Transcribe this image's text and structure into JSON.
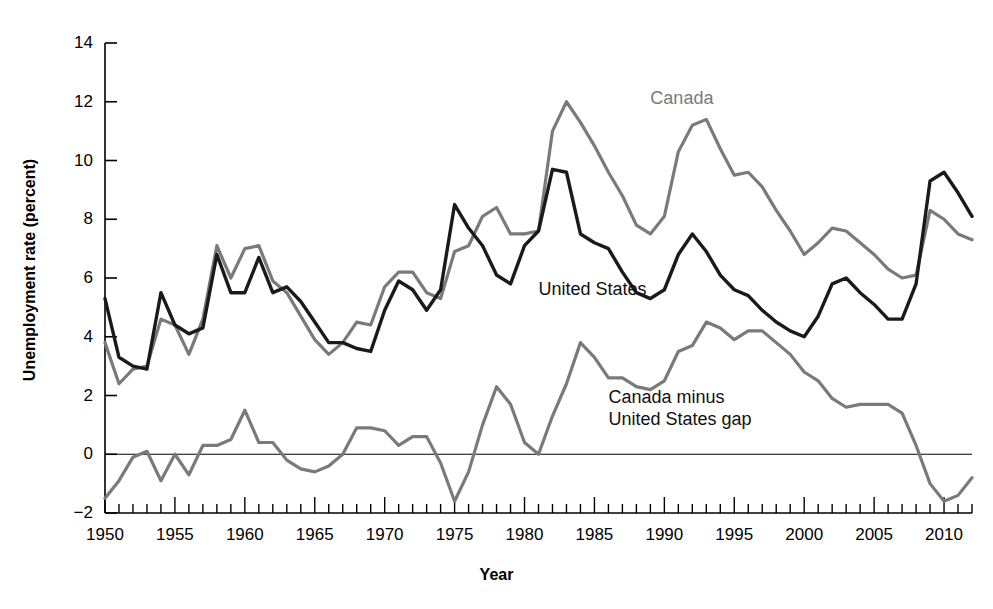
{
  "chart_data": {
    "type": "line",
    "title": "",
    "xlabel": "Year",
    "ylabel": "Unemployment rate (percent)",
    "xlim": [
      1950,
      2012
    ],
    "ylim": [
      -2,
      14
    ],
    "ytick_step": 2,
    "xtick_step": 5,
    "minor_xticks": "annual",
    "grid": false,
    "zero_line": true,
    "legend_position": "inline-annotations",
    "x": [
      1950,
      1951,
      1952,
      1953,
      1954,
      1955,
      1956,
      1957,
      1958,
      1959,
      1960,
      1961,
      1962,
      1963,
      1964,
      1965,
      1966,
      1967,
      1968,
      1969,
      1970,
      1971,
      1972,
      1973,
      1974,
      1975,
      1976,
      1977,
      1978,
      1979,
      1980,
      1981,
      1982,
      1983,
      1984,
      1985,
      1986,
      1987,
      1988,
      1989,
      1990,
      1991,
      1992,
      1993,
      1994,
      1995,
      1996,
      1997,
      1998,
      1999,
      2000,
      2001,
      2002,
      2003,
      2004,
      2005,
      2006,
      2007,
      2008,
      2009,
      2010,
      2011,
      2012
    ],
    "xticks": [
      1950,
      1955,
      1960,
      1965,
      1970,
      1975,
      1980,
      1985,
      1990,
      1995,
      2000,
      2005,
      2010
    ],
    "xtick_labels": [
      "1950",
      "1955",
      "1960",
      "1965",
      "1970",
      "1975",
      "1980",
      "1985",
      "1990",
      "1995",
      "2000",
      "2005",
      "2010"
    ],
    "yticks": [
      -2,
      0,
      2,
      4,
      6,
      8,
      10,
      12,
      14
    ],
    "ytick_labels": [
      "−2",
      "0",
      "2",
      "4",
      "6",
      "8",
      "10",
      "12",
      "14"
    ],
    "series": [
      {
        "name": "United States",
        "color": "#1a1a1a",
        "label_x": 1981,
        "label_y": 5.6,
        "values": [
          5.3,
          3.3,
          3.0,
          2.9,
          5.5,
          4.4,
          4.1,
          4.3,
          6.8,
          5.5,
          5.5,
          6.7,
          5.5,
          5.7,
          5.2,
          4.5,
          3.8,
          3.8,
          3.6,
          3.5,
          4.9,
          5.9,
          5.6,
          4.9,
          5.6,
          8.5,
          7.7,
          7.1,
          6.1,
          5.8,
          7.1,
          7.6,
          9.7,
          9.6,
          7.5,
          7.2,
          7.0,
          6.2,
          5.5,
          5.3,
          5.6,
          6.8,
          7.5,
          6.9,
          6.1,
          5.6,
          5.4,
          4.9,
          4.5,
          4.2,
          4.0,
          4.7,
          5.8,
          6.0,
          5.5,
          5.1,
          4.6,
          4.6,
          5.8,
          9.3,
          9.6,
          8.9,
          8.1
        ]
      },
      {
        "name": "Canada",
        "color": "#7a7a7a",
        "label_x": 1989,
        "label_y": 12.1,
        "values": [
          3.8,
          2.4,
          2.9,
          3.0,
          4.6,
          4.4,
          3.4,
          4.6,
          7.1,
          6.0,
          7.0,
          7.1,
          5.9,
          5.5,
          4.7,
          3.9,
          3.4,
          3.8,
          4.5,
          4.4,
          5.7,
          6.2,
          6.2,
          5.5,
          5.3,
          6.9,
          7.1,
          8.1,
          8.4,
          7.5,
          7.5,
          7.6,
          11.0,
          12.0,
          11.3,
          10.5,
          9.6,
          8.8,
          7.8,
          7.5,
          8.1,
          10.3,
          11.2,
          11.4,
          10.4,
          9.5,
          9.6,
          9.1,
          8.3,
          7.6,
          6.8,
          7.2,
          7.7,
          7.6,
          7.2,
          6.8,
          6.3,
          6.0,
          6.1,
          8.3,
          8.0,
          7.5,
          7.3
        ]
      },
      {
        "name": "Canada minus United States gap",
        "color": "#7a7a7a",
        "label_x": 1986,
        "label_y": 1.9,
        "values": [
          -1.5,
          -0.9,
          -0.1,
          0.1,
          -0.9,
          0.0,
          -0.7,
          0.3,
          0.3,
          0.5,
          1.5,
          0.4,
          0.4,
          -0.2,
          -0.5,
          -0.6,
          -0.4,
          0.0,
          0.9,
          0.9,
          0.8,
          0.3,
          0.6,
          0.6,
          -0.3,
          -1.6,
          -0.6,
          1.0,
          2.3,
          1.7,
          0.4,
          0.0,
          1.3,
          2.4,
          3.8,
          3.3,
          2.6,
          2.6,
          2.3,
          2.2,
          2.5,
          3.5,
          3.7,
          4.5,
          4.3,
          3.9,
          4.2,
          4.2,
          3.8,
          3.4,
          2.8,
          2.5,
          1.9,
          1.6,
          1.7,
          1.7,
          1.7,
          1.4,
          0.3,
          -1.0,
          -1.6,
          -1.4,
          -0.8
        ]
      }
    ],
    "annotations": [
      {
        "id": "canada",
        "text": "Canada"
      },
      {
        "id": "united-states",
        "text": "United States"
      },
      {
        "id": "gap-line1",
        "text": "Canada minus"
      },
      {
        "id": "gap-line2",
        "text": "United States gap"
      }
    ]
  }
}
